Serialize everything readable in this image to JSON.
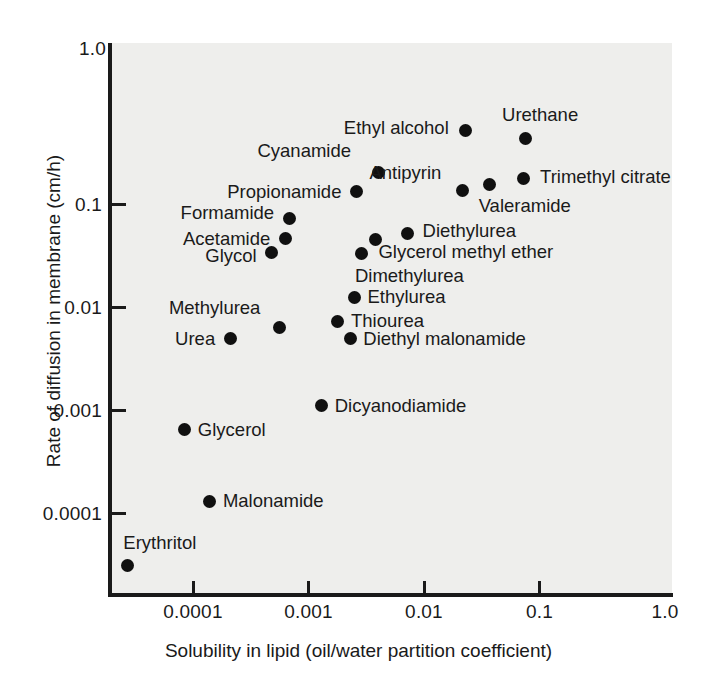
{
  "figure": {
    "background_color": "#ffffff",
    "plot_background_color": "#eeeeec",
    "marker_color": "#101010",
    "axis_color": "#1a1a1a"
  },
  "chart_data": {
    "type": "scatter",
    "title": "",
    "xlabel": "Solubility in lipid (oil/water partition coefficient)",
    "ylabel": "Rate of diffusion in membrane (cm/h)",
    "xscale": "log",
    "yscale": "log",
    "xlim": [
      2e-05,
      1.0
    ],
    "ylim": [
      2e-05,
      1.0
    ],
    "grid": false,
    "legend": "none",
    "xticks": [
      "0.0001",
      "0.001",
      "0.01",
      "0.1",
      "1.0"
    ],
    "xtick_values": [
      0.0001,
      0.001,
      0.01,
      0.1,
      1.0
    ],
    "yticks": [
      "1.0",
      "0.1",
      "0.01",
      "0.001",
      "0.0001"
    ],
    "ytick_values": [
      1.0,
      0.1,
      0.01,
      0.001,
      0.0001
    ],
    "points": [
      {
        "label": "Ethyl alcohol",
        "x": 0.023,
        "y": 0.52,
        "label_side": "left"
      },
      {
        "label": "Urethane",
        "x": 0.075,
        "y": 0.43,
        "label_side": "right"
      },
      {
        "label": "Cyanamide",
        "x": 0.004,
        "y": 0.2,
        "label_side": "left"
      },
      {
        "label": "Antipyrin",
        "x": 0.0215,
        "y": 0.135,
        "label_side": "left"
      },
      {
        "label": "Trimethyl citrate",
        "x": 0.072,
        "y": 0.175,
        "label_side": "right"
      },
      {
        "label": "Valeramide",
        "x": 0.037,
        "y": 0.155,
        "label_side": "right"
      },
      {
        "label": "Propionamide",
        "x": 0.0026,
        "y": 0.131,
        "label_side": "left"
      },
      {
        "label": "Formamide",
        "x": 0.00068,
        "y": 0.072,
        "label_side": "left"
      },
      {
        "label": "Acetamide",
        "x": 0.00063,
        "y": 0.046,
        "label_side": "left"
      },
      {
        "label": "Glycol",
        "x": 0.00048,
        "y": 0.034,
        "label_side": "left"
      },
      {
        "label": "Diethylurea",
        "x": 0.0072,
        "y": 0.052,
        "label_side": "right"
      },
      {
        "label": "Glycerol methyl ether",
        "x": 0.0038,
        "y": 0.045,
        "label_side": "right"
      },
      {
        "label": "Dimethylurea",
        "x": 0.0029,
        "y": 0.033,
        "label_side": "right"
      },
      {
        "label": "Ethylurea",
        "x": 0.0025,
        "y": 0.0125,
        "label_side": "right"
      },
      {
        "label": "Methylurea",
        "x": 0.00056,
        "y": 0.0063,
        "label_side": "left"
      },
      {
        "label": "Thiourea",
        "x": 0.0018,
        "y": 0.0073,
        "label_side": "right"
      },
      {
        "label": "Urea",
        "x": 0.00021,
        "y": 0.0049,
        "label_side": "left"
      },
      {
        "label": "Diethyl malonamide",
        "x": 0.0023,
        "y": 0.0049,
        "label_side": "right"
      },
      {
        "label": "Dicyanodiamide",
        "x": 0.0013,
        "y": 0.0011,
        "label_side": "right"
      },
      {
        "label": "Glycerol",
        "x": 8.5e-05,
        "y": 0.00064,
        "label_side": "right"
      },
      {
        "label": "Malonamide",
        "x": 0.00014,
        "y": 0.00013,
        "label_side": "right"
      },
      {
        "label": "Erythritol",
        "x": 2.7e-05,
        "y": 3.1e-05,
        "label_side": "erythritol"
      }
    ]
  }
}
